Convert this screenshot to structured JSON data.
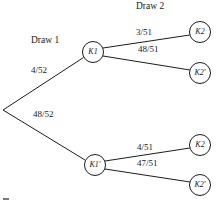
{
  "diagram": {
    "stages": [
      {
        "id": "stage-1",
        "label": "Draw 1",
        "x": 31,
        "y": 36
      },
      {
        "id": "stage-2",
        "label": "Draw 2",
        "x": 136,
        "y": 2
      }
    ],
    "nodes": [
      {
        "id": "root",
        "label": "",
        "cx": 3,
        "cy": 110,
        "r": 0,
        "visible": false
      },
      {
        "id": "k1",
        "label": "K1",
        "cx": 93,
        "cy": 52,
        "r": 10.5,
        "visible": true
      },
      {
        "id": "k1prime",
        "label": "K1'",
        "cx": 95,
        "cy": 165,
        "r": 10.5,
        "visible": true
      },
      {
        "id": "k2-top",
        "label": "K2",
        "cx": 200,
        "cy": 32,
        "r": 10.5,
        "visible": true
      },
      {
        "id": "k2prime-top",
        "label": "K2'",
        "cx": 200,
        "cy": 73,
        "r": 10.5,
        "visible": true
      },
      {
        "id": "k2-bottom",
        "label": "K2",
        "cx": 200,
        "cy": 145,
        "r": 10.5,
        "visible": true
      },
      {
        "id": "k2prime-bottom",
        "label": "K2'",
        "cx": 200,
        "cy": 185,
        "r": 10.5,
        "visible": true
      }
    ],
    "edges": [
      {
        "id": "edge-root-k1",
        "from": "root",
        "to": "k1",
        "label": "4/52",
        "label_x": 31,
        "label_y": 66
      },
      {
        "id": "edge-root-k1prime",
        "from": "root",
        "to": "k1prime",
        "label": "48/52",
        "label_x": 33,
        "label_y": 110
      },
      {
        "id": "edge-k1-k2",
        "from": "k1",
        "to": "k2-top",
        "label": "3/51",
        "label_x": 136,
        "label_y": 28
      },
      {
        "id": "edge-k1-k2prime",
        "from": "k1",
        "to": "k2prime-top",
        "label": "48/51",
        "label_x": 138,
        "label_y": 45
      },
      {
        "id": "edge-k1prime-k2",
        "from": "k1prime",
        "to": "k2-bottom",
        "label": "4/51",
        "label_x": 137,
        "label_y": 143
      },
      {
        "id": "edge-k1prime-k2prime",
        "from": "k1prime",
        "to": "k2prime-bottom",
        "label": "47/51",
        "label_x": 137,
        "label_y": 159
      }
    ],
    "colors": {
      "stroke": "#1c1c1c",
      "text": "#1a1a1a",
      "background": "#ffffff"
    }
  }
}
